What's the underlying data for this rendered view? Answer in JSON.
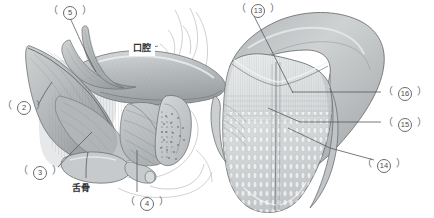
{
  "figure": {
    "title": "",
    "background_color": "#ffffff",
    "type": "anatomical-illustration",
    "panels": [
      {
        "id": "left-panel",
        "name": "sagittal-section-floor-of-mouth",
        "description": "sagittal view of tongue, floor of mouth muscles and hyoid bone"
      },
      {
        "id": "right-panel",
        "name": "tongue-dorsum-view",
        "description": "dorsal surface of the tongue showing papillae and median sulcus"
      }
    ]
  },
  "labels": {
    "left": [
      {
        "key": "l5",
        "open": "（",
        "number": "5",
        "close": "）",
        "x": 48,
        "y": 5,
        "name": "label-5"
      },
      {
        "key": "l2",
        "open": "（",
        "number": "2",
        "close": "）",
        "x": 2,
        "y": 100,
        "name": "label-2"
      },
      {
        "key": "l3",
        "open": "（",
        "number": "3",
        "close": "）",
        "x": 18,
        "y": 165,
        "name": "label-3"
      },
      {
        "key": "l4",
        "open": "（",
        "number": "4",
        "close": "）",
        "x": 125,
        "y": 196,
        "name": "label-4"
      }
    ],
    "right": [
      {
        "key": "r13",
        "open": "（",
        "number": "13",
        "close": "）",
        "x": 236,
        "y": 3,
        "name": "label-13"
      },
      {
        "key": "r16",
        "open": "（",
        "number": "16",
        "close": "）",
        "x": 383,
        "y": 86,
        "name": "label-16"
      },
      {
        "key": "r15",
        "open": "（",
        "number": "15",
        "close": "）",
        "x": 383,
        "y": 117,
        "name": "label-15"
      },
      {
        "key": "r14",
        "open": "（",
        "number": "14",
        "close": "）",
        "x": 362,
        "y": 158,
        "name": "label-14"
      }
    ]
  },
  "annotations": {
    "oral_cavity": {
      "text": "口腔",
      "x": 129,
      "y": 40,
      "name": "oral-cavity-label"
    },
    "hyoid_bone": {
      "text": "舌骨",
      "x": 72,
      "y": 181,
      "name": "hyoid-bone-label"
    }
  },
  "colors": {
    "line": "#6a6b6d",
    "text": "#58595b",
    "jp_text": "#2f3032",
    "muscle_fill": "#b9bcbd",
    "muscle_dark": "#8f9395",
    "tongue_light": "#dcdedf",
    "tongue_mid": "#c6c9cb",
    "outline": "#6e7173",
    "background": "#ffffff"
  }
}
